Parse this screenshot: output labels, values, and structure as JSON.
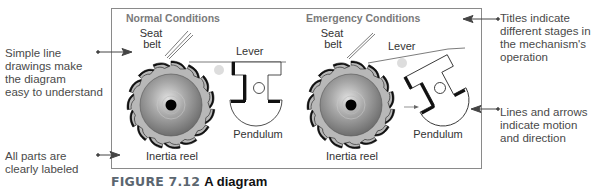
{
  "figure": {
    "number_label": "FIGURE 7.12",
    "title": "A diagram"
  },
  "panels": [
    {
      "title": "Normal Conditions",
      "labels": {
        "seat_belt_line1": "Seat",
        "seat_belt_line2": "belt",
        "lever": "Lever",
        "pendulum": "Pendulum",
        "reel": "Inertia reel"
      }
    },
    {
      "title": "Emergency Conditions",
      "labels": {
        "seat_belt_line1": "Seat",
        "seat_belt_line2": "belt",
        "lever": "Lever",
        "pendulum": "Pendulum",
        "reel": "Inertia reel"
      }
    }
  ],
  "callouts": {
    "left_top": [
      "Simple line",
      "drawings make",
      "the diagram",
      "easy to understand"
    ],
    "left_bottom": [
      "All parts are",
      "clearly labeled"
    ],
    "right_top": [
      "Titles indicate",
      "different stages in",
      "the mechanism's",
      "operation"
    ],
    "right_bottom": [
      "Lines and arrows",
      "indicate motion",
      "and direction"
    ]
  },
  "colors": {
    "frame": "#8a8a8a",
    "title_gray": "#7a7a7a",
    "reel_teeth": "#b5b5b5",
    "reel_body": "#8f8f8f",
    "caption_label": "#5b6670",
    "text": "#3a3a3a"
  }
}
